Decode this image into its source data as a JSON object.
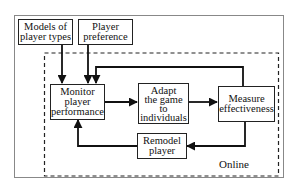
{
  "diagram": {
    "type": "flowchart",
    "inputs": [
      {
        "id": "models",
        "lines": [
          "Models of",
          "player types"
        ]
      },
      {
        "id": "preference",
        "lines": [
          "Player",
          "preference"
        ]
      }
    ],
    "nodes": [
      {
        "id": "monitor",
        "lines": [
          "Monitor",
          "player",
          "performance"
        ]
      },
      {
        "id": "adapt",
        "lines": [
          "Adapt",
          "the game",
          "to",
          "individuals"
        ]
      },
      {
        "id": "measure",
        "lines": [
          "Measure",
          "effectiveness"
        ]
      },
      {
        "id": "remodel",
        "lines": [
          "Remodel",
          "player"
        ]
      }
    ],
    "region_label": "Online",
    "edges": [
      {
        "from": "models",
        "to": "monitor"
      },
      {
        "from": "preference",
        "to": "monitor"
      },
      {
        "from": "monitor",
        "to": "adapt"
      },
      {
        "from": "adapt",
        "to": "measure"
      },
      {
        "from": "measure",
        "to": "monitor",
        "route": "top-feedback"
      },
      {
        "from": "measure",
        "to": "remodel"
      },
      {
        "from": "remodel",
        "to": "monitor"
      }
    ],
    "colors": {
      "line": "#111111",
      "outer_border": "#888888",
      "background": "#ffffff"
    }
  }
}
